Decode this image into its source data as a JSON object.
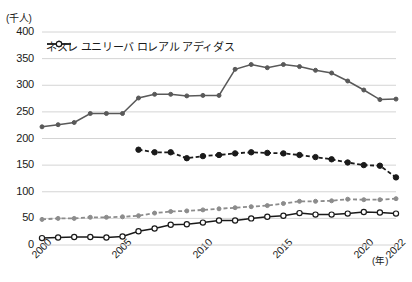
{
  "chart_data": {
    "type": "line",
    "title": "",
    "ylabel": "(千人)",
    "xlabel": "(年)",
    "ylim": [
      0,
      400
    ],
    "ytick_step": 50,
    "yticks": [
      "400",
      "350",
      "300",
      "250",
      "200",
      "150",
      "100",
      "50",
      "0"
    ],
    "xticks": [
      "2000",
      "2005",
      "2010",
      "2015",
      "2020",
      "2022"
    ],
    "xlim": [
      2000,
      2022
    ],
    "grid": "horizontal",
    "legend_position": "top-inside",
    "x": [
      2000,
      2001,
      2002,
      2003,
      2004,
      2005,
      2006,
      2007,
      2008,
      2009,
      2010,
      2011,
      2012,
      2013,
      2014,
      2015,
      2016,
      2017,
      2018,
      2019,
      2020,
      2021,
      2022
    ],
    "series": [
      {
        "name": "ネスレ",
        "color": "#595959",
        "style": "solid",
        "marker": "filled-circle",
        "values": [
          222,
          226,
          230,
          247,
          247,
          247,
          276,
          283,
          283,
          280,
          281,
          281,
          330,
          339,
          333,
          339,
          335,
          328,
          323,
          308,
          291,
          273,
          274
        ]
      },
      {
        "name": "ユニリーバ",
        "color": "#1a1a1a",
        "style": "dashed",
        "marker": "filled-circle-bold",
        "values": [
          null,
          null,
          null,
          null,
          null,
          null,
          179,
          174,
          174,
          163,
          167,
          169,
          172,
          174,
          173,
          172,
          169,
          165,
          161,
          155,
          150,
          149,
          127
        ]
      },
      {
        "name": "ロレアル",
        "color": "#8c8c8c",
        "style": "dashed",
        "marker": "filled-circle-small",
        "values": [
          48,
          50,
          50,
          52,
          52,
          53,
          55,
          60,
          63,
          64,
          66,
          68,
          70,
          72,
          74,
          78,
          82,
          82,
          83,
          86,
          85,
          85,
          87
        ]
      },
      {
        "name": "アディダス",
        "color": "#1a1a1a",
        "style": "solid",
        "marker": "open-circle",
        "values": [
          13,
          14,
          15,
          15,
          14,
          16,
          26,
          31,
          38,
          39,
          42,
          46,
          46,
          50,
          53,
          55,
          60,
          57,
          57,
          59,
          62,
          61,
          59
        ]
      }
    ]
  }
}
